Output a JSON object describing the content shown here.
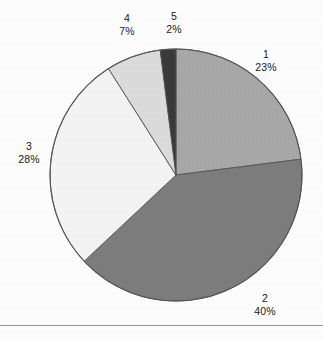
{
  "figure": {
    "background_color": "#fdfdfd",
    "rule_color": "#9a9a9a",
    "outline_color": "#555555"
  },
  "chart_data": {
    "type": "pie",
    "title": "",
    "subtitle": "",
    "xlabel": "",
    "ylabel": "",
    "legend_position": "none",
    "grid": false,
    "start_angle_deg": 0,
    "direction": "clockwise",
    "center": {
      "x": 176,
      "y": 175
    },
    "radius": 126,
    "units": "percent",
    "categories": [
      "1",
      "2",
      "3",
      "4",
      "5"
    ],
    "values": [
      23,
      40,
      28,
      7,
      2
    ],
    "labels": [
      "23%",
      "40%",
      "28%",
      "7%",
      "2%"
    ],
    "colors": [
      "#a8a8a8",
      "#7d7d7d",
      "#f4f4f4",
      "#dcdcdc",
      "#3a3a3a"
    ],
    "slices": [
      {
        "name": "1",
        "value": 23,
        "label": "23%",
        "color": "#a8a8a8",
        "start_deg": 0,
        "end_deg": 82.8,
        "label_x": 266,
        "label_y": 60
      },
      {
        "name": "2",
        "value": 40,
        "label": "40%",
        "color": "#7d7d7d",
        "start_deg": 82.8,
        "end_deg": 226.8,
        "label_x": 265,
        "label_y": 304
      },
      {
        "name": "3",
        "value": 28,
        "label": "28%",
        "color": "#f4f4f4",
        "start_deg": 226.8,
        "end_deg": 327.6,
        "label_x": 29,
        "label_y": 152
      },
      {
        "name": "4",
        "value": 7,
        "label": "7%",
        "color": "#dcdcdc",
        "start_deg": 327.6,
        "end_deg": 352.8,
        "label_x": 127,
        "label_y": 24
      },
      {
        "name": "5",
        "value": 2,
        "label": "2%",
        "color": "#3a3a3a",
        "start_deg": 352.8,
        "end_deg": 360,
        "label_x": 174,
        "label_y": 22
      }
    ]
  }
}
